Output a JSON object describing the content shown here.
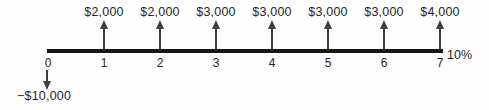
{
  "figure": {
    "rate_label": "10%",
    "outflow": {
      "period": 0,
      "amount": "−$10,000"
    },
    "inflows": [
      {
        "period": 1,
        "amount": "$2,000"
      },
      {
        "period": 2,
        "amount": "$2,000"
      },
      {
        "period": 3,
        "amount": "$3,000"
      },
      {
        "period": 4,
        "amount": "$3,000"
      },
      {
        "period": 5,
        "amount": "$3,000"
      },
      {
        "period": 6,
        "amount": "$3,000"
      },
      {
        "period": 7,
        "amount": "$4,000"
      }
    ],
    "period_labels": [
      "0",
      "1",
      "2",
      "3",
      "4",
      "5",
      "6",
      "7"
    ],
    "colors": {
      "line": "#161616",
      "arrow": "#3e3e3e",
      "text": "#262626",
      "background": "#fefefe"
    }
  },
  "chart_data": {
    "type": "bar",
    "categories": [
      0,
      1,
      2,
      3,
      4,
      5,
      6,
      7
    ],
    "values": [
      -10000,
      2000,
      2000,
      3000,
      3000,
      3000,
      3000,
      4000
    ],
    "title": "",
    "xlabel": "",
    "ylabel": "",
    "annotations": [
      "10%"
    ],
    "legend": []
  }
}
